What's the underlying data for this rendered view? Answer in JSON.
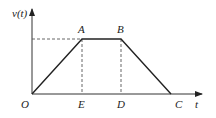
{
  "diagram": {
    "axes": {
      "y_label": "v(t)",
      "x_label": "t",
      "origin_label": "O"
    },
    "points": [
      {
        "id": "O",
        "label": "O"
      },
      {
        "id": "A",
        "label": "A"
      },
      {
        "id": "B",
        "label": "B"
      },
      {
        "id": "C",
        "label": "C"
      },
      {
        "id": "D",
        "label": "D"
      },
      {
        "id": "E",
        "label": "E"
      }
    ],
    "colors": {
      "line": "#222222",
      "dashed": "#555555"
    }
  }
}
